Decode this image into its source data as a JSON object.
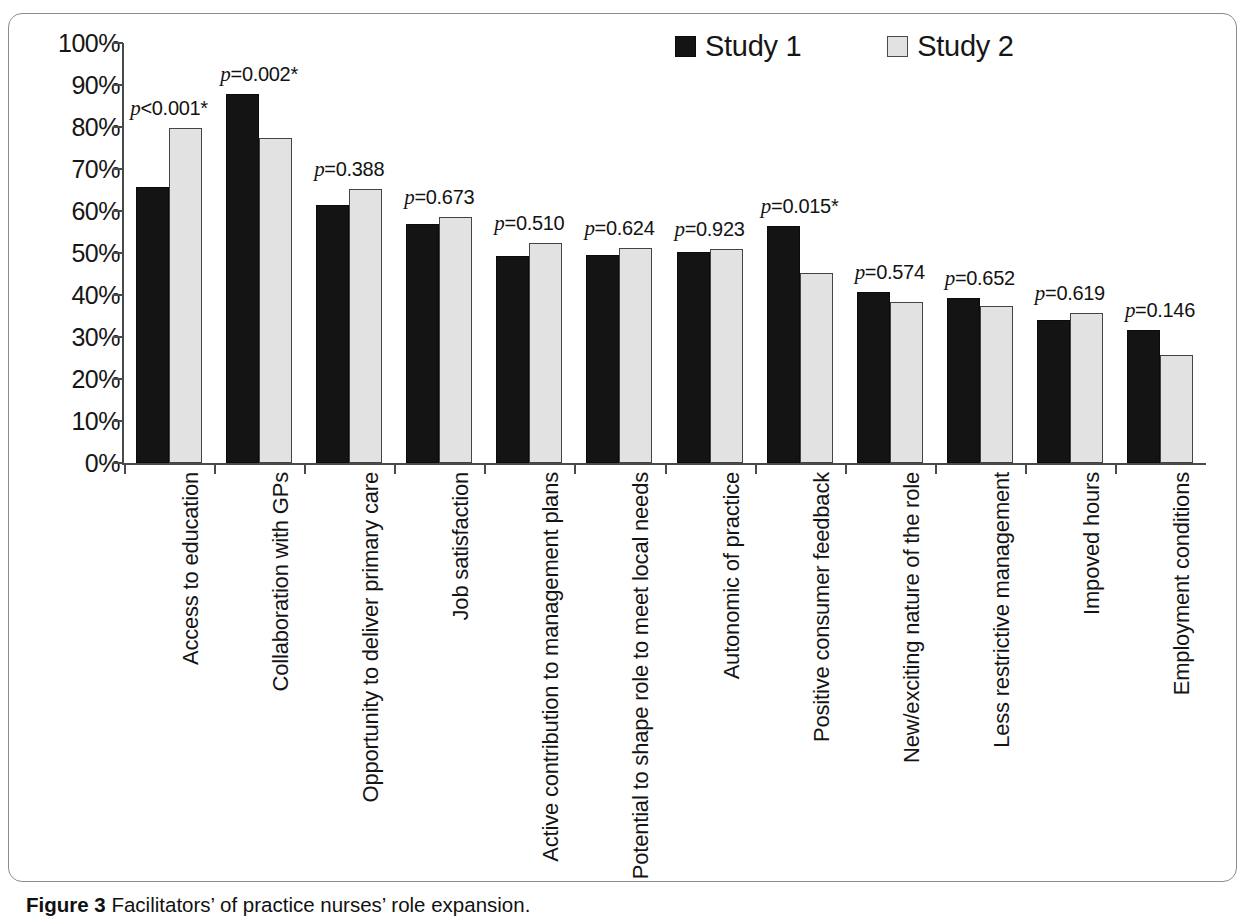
{
  "caption": {
    "prefix": "Figure 3",
    "text": " Facilitators’ of practice nurses’ role expansion."
  },
  "legend": {
    "position": "top-center-right",
    "items": [
      {
        "label": "Study 1",
        "color": "#141414",
        "swatch": "filled-square-icon"
      },
      {
        "label": "Study 2",
        "color": "#e2e2e2",
        "swatch": "outlined-square-icon"
      }
    ]
  },
  "axis": {
    "y_ticks": [
      "100%",
      "90%",
      "80%",
      "70%",
      "60%",
      "50%",
      "40%",
      "30%",
      "20%",
      "10%",
      "0%"
    ],
    "y_min": 0,
    "y_max": 100
  },
  "chart_data": {
    "type": "bar",
    "title": "Facilitators’ of practice nurses’ role expansion",
    "xlabel": "",
    "ylabel": "",
    "ylim": [
      0,
      100
    ],
    "grid": false,
    "legend_position": "top",
    "categories": [
      "Access to education",
      "Collaboration with GPs",
      "Opportunity to deliver primary care",
      "Job satisfaction",
      "Active contribution to management plans",
      "Potential to shape role to meet local needs",
      "Autonomic of practice",
      "Positive consumer feedback",
      "New/exciting nature of the role",
      "Less restrictive management",
      "Impoved hours",
      "Employment conditions"
    ],
    "series": [
      {
        "name": "Study 1",
        "values": [
          65.8,
          87.8,
          61.4,
          57.0,
          49.3,
          49.6,
          50.3,
          56.4,
          40.8,
          39.3,
          34.0,
          31.6
        ]
      },
      {
        "name": "Study 2",
        "values": [
          79.7,
          77.4,
          65.2,
          58.5,
          52.4,
          51.3,
          50.9,
          45.3,
          38.3,
          37.4,
          35.8,
          25.8
        ]
      }
    ],
    "annotations": [
      "p<0.001*",
      "p=0.002*",
      "p=0.388",
      "p=0.673",
      "p=0.510",
      "p=0.624",
      "p=0.923",
      "p=0.015*",
      "p=0.574",
      "p=0.652",
      "p=0.619",
      "p=0.146"
    ],
    "annotation_rest": [
      "<0.001*",
      "=0.002*",
      "=0.388",
      "=0.673",
      "=0.510",
      "=0.624",
      "=0.923",
      "=0.015*",
      "=0.574",
      "=0.652",
      "=0.619",
      "=0.146"
    ]
  }
}
